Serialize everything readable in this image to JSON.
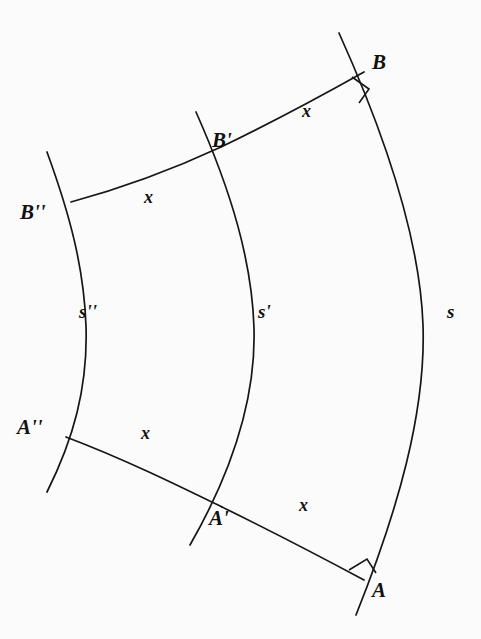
{
  "figure": {
    "kind": "geometry-diagram",
    "background_color": "#fbfbfb",
    "stroke_color": "#161616"
  },
  "points": [
    {
      "id": "B",
      "label": "B",
      "base": "B",
      "primes": "",
      "x": 372,
      "y": 62
    },
    {
      "id": "Bp",
      "label": "B'",
      "base": "B",
      "primes": "'",
      "x": 212,
      "y": 140
    },
    {
      "id": "Bpp",
      "label": "B''",
      "base": "B",
      "primes": "''",
      "x": 25,
      "y": 212
    },
    {
      "id": "A",
      "label": "A",
      "base": "A",
      "primes": "",
      "x": 370,
      "y": 589
    },
    {
      "id": "Ap",
      "label": "A'",
      "base": "A",
      "primes": "'",
      "x": 211,
      "y": 518
    },
    {
      "id": "App",
      "label": "A''",
      "base": "A",
      "primes": "''",
      "x": 22,
      "y": 427
    }
  ],
  "arc_labels": [
    {
      "id": "s",
      "label": "s",
      "base": "s",
      "primes": "",
      "x": 447,
      "y": 310,
      "belongs_to": "outer-arc"
    },
    {
      "id": "sp",
      "label": "s'",
      "base": "s",
      "primes": "'",
      "x": 258,
      "y": 310,
      "belongs_to": "middle-arc"
    },
    {
      "id": "spp",
      "label": "s''",
      "base": "s",
      "primes": "''",
      "x": 79,
      "y": 310,
      "belongs_to": "inner-arc"
    }
  ],
  "segment_labels": [
    {
      "id": "x-top-right",
      "label": "x",
      "x": 302,
      "y": 110,
      "between": "B' to B"
    },
    {
      "id": "x-top-left",
      "label": "x",
      "x": 144,
      "y": 196,
      "between": "B'' to B'"
    },
    {
      "id": "x-bottom-left",
      "label": "x",
      "x": 141,
      "y": 432,
      "between": "A'' to A'"
    },
    {
      "id": "x-bottom-right",
      "label": "x",
      "x": 299,
      "y": 504,
      "between": "A' to A"
    }
  ],
  "angle_markers": [
    {
      "id": "right-angle-at-B",
      "kind": "right-angle",
      "at_point": "B",
      "x": 359,
      "y": 87
    },
    {
      "id": "right-angle-at-A",
      "kind": "right-angle",
      "at_point": "A",
      "x": 356,
      "y": 562
    }
  ],
  "curves": [
    {
      "id": "outer-arc",
      "name": "s",
      "path": "M 339 33 C 385 135, 420 240, 423 325 C 426 412, 398 510, 356 615"
    },
    {
      "id": "middle-arc",
      "name": "s-prime",
      "path": "M 196 112 C 232 193, 252 262, 254 328 C 256 398, 233 470, 190 545"
    },
    {
      "id": "inner-arc",
      "name": "s-double-prime",
      "path": "M 47 152 C 70 215, 84 268, 86 326 C 88 388, 73 440, 47 492"
    }
  ],
  "connectors": [
    {
      "id": "connector-Bpp-Bp",
      "name": "x-arc-upper-left",
      "path": "M 71 202 C 130 186, 180 166, 221 147"
    },
    {
      "id": "connector-Bp-B",
      "name": "x-arc-upper-right",
      "path": "M 221 147 C 273 122, 323 95, 364 72"
    },
    {
      "id": "connector-App-Ap",
      "name": "x-arc-lower-left",
      "path": "M 66 437 C 124 459, 177 485, 222 507"
    },
    {
      "id": "connector-Ap-A",
      "name": "x-arc-lower-right",
      "path": "M 222 507 C 271 531, 323 558, 364 580"
    }
  ]
}
